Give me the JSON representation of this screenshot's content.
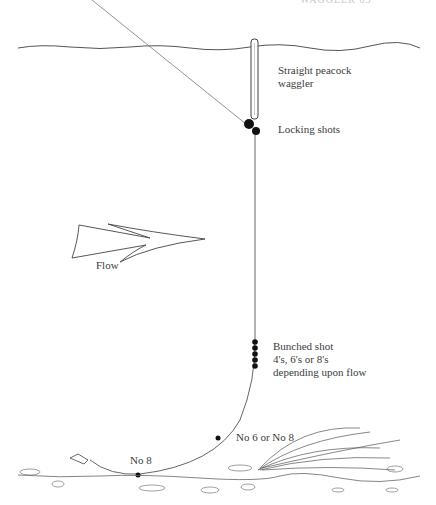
{
  "page": {
    "running_header": "WAGGLER  65"
  },
  "diagram": {
    "type": "fishing rig illustration",
    "labels": {
      "float": [
        "Straight peacock",
        "waggler"
      ],
      "locking_shots": "Locking shots",
      "flow": "Flow",
      "bunched_shot": [
        "Bunched shot",
        "4's, 6's or 8's",
        "depending upon flow"
      ],
      "mid_shot": "No 6 or No 8",
      "bottom_shot": "No 8"
    },
    "colors": {
      "ink": "#3a3a3a",
      "line": "#555555",
      "shot": "#111111",
      "background": "#ffffff"
    }
  }
}
